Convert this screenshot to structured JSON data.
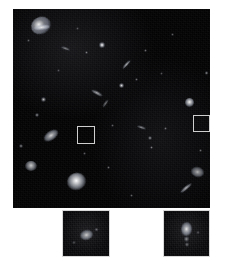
{
  "figure": {
    "background_color": "#ffffff",
    "sky_color": "#050506",
    "marker_color": "#cfcfcf",
    "caption": ""
  },
  "main_panel": {
    "name": "deep-field-image",
    "x": 13,
    "y": 9,
    "width": 197,
    "height": 199,
    "background": "#030304",
    "sources": [
      {
        "id": "spiral-galaxy-upper-left",
        "x": 18,
        "y": 8,
        "w": 20,
        "h": 17,
        "brightness": 0.95,
        "shape": "spiral",
        "angle": -25
      },
      {
        "id": "compact-source-1",
        "x": 14,
        "y": 30,
        "w": 3,
        "h": 3,
        "brightness": 0.35,
        "shape": "point",
        "angle": 0
      },
      {
        "id": "edge-on-disk-1",
        "x": 48,
        "y": 38,
        "w": 9,
        "h": 3,
        "brightness": 0.55,
        "shape": "edge-on",
        "angle": 20
      },
      {
        "id": "bright-star-1",
        "x": 86,
        "y": 33,
        "w": 6,
        "h": 6,
        "brightness": 1.0,
        "shape": "point",
        "angle": 0
      },
      {
        "id": "compact-source-2",
        "x": 72,
        "y": 42,
        "w": 3,
        "h": 3,
        "brightness": 0.45,
        "shape": "point",
        "angle": 0
      },
      {
        "id": "compact-source-3",
        "x": 131,
        "y": 40,
        "w": 3,
        "h": 3,
        "brightness": 0.4,
        "shape": "point",
        "angle": 0
      },
      {
        "id": "streak-source-1",
        "x": 108,
        "y": 54,
        "w": 11,
        "h": 3,
        "brightness": 0.8,
        "shape": "edge-on",
        "angle": -48
      },
      {
        "id": "compact-source-4",
        "x": 122,
        "y": 69,
        "w": 3,
        "h": 3,
        "brightness": 0.4,
        "shape": "point",
        "angle": 0
      },
      {
        "id": "bright-star-2",
        "x": 106,
        "y": 74,
        "w": 5,
        "h": 5,
        "brightness": 0.85,
        "shape": "point",
        "angle": 0
      },
      {
        "id": "edge-on-disk-2",
        "x": 78,
        "y": 82,
        "w": 12,
        "h": 4,
        "brightness": 0.7,
        "shape": "edge-on",
        "angle": 28
      },
      {
        "id": "edge-on-disk-3",
        "x": 88,
        "y": 93,
        "w": 9,
        "h": 3,
        "brightness": 0.5,
        "shape": "edge-on",
        "angle": -55
      },
      {
        "id": "compact-source-5",
        "x": 28,
        "y": 88,
        "w": 5,
        "h": 5,
        "brightness": 0.7,
        "shape": "point",
        "angle": 0
      },
      {
        "id": "compact-source-6",
        "x": 22,
        "y": 104,
        "w": 4,
        "h": 4,
        "brightness": 0.55,
        "shape": "point",
        "angle": 0
      },
      {
        "id": "bright-round-galaxy",
        "x": 172,
        "y": 89,
        "w": 9,
        "h": 9,
        "brightness": 0.95,
        "shape": "round",
        "angle": 0
      },
      {
        "id": "compact-source-7",
        "x": 192,
        "y": 62,
        "w": 3,
        "h": 4,
        "brightness": 0.55,
        "shape": "point",
        "angle": 0
      },
      {
        "id": "compact-source-8",
        "x": 151,
        "y": 118,
        "w": 3,
        "h": 3,
        "brightness": 0.4,
        "shape": "point",
        "angle": 0
      },
      {
        "id": "edge-on-disk-4",
        "x": 124,
        "y": 117,
        "w": 9,
        "h": 3,
        "brightness": 0.6,
        "shape": "edge-on",
        "angle": 18
      },
      {
        "id": "compact-source-9",
        "x": 135,
        "y": 127,
        "w": 4,
        "h": 4,
        "brightness": 0.55,
        "shape": "point",
        "angle": 0
      },
      {
        "id": "compact-source-10",
        "x": 137,
        "y": 137,
        "w": 3,
        "h": 3,
        "brightness": 0.45,
        "shape": "point",
        "angle": 0
      },
      {
        "id": "compact-source-11",
        "x": 98,
        "y": 115,
        "w": 3,
        "h": 3,
        "brightness": 0.35,
        "shape": "point",
        "angle": 0
      },
      {
        "id": "inclined-galaxy-1",
        "x": 30,
        "y": 122,
        "w": 16,
        "h": 9,
        "brightness": 0.85,
        "shape": "ellipse",
        "angle": -35
      },
      {
        "id": "compact-source-12",
        "x": 6,
        "y": 135,
        "w": 4,
        "h": 4,
        "brightness": 0.5,
        "shape": "point",
        "angle": 0
      },
      {
        "id": "elliptical-galaxy-2",
        "x": 12,
        "y": 152,
        "w": 12,
        "h": 10,
        "brightness": 0.78,
        "shape": "round",
        "angle": 0
      },
      {
        "id": "bright-elliptical-main",
        "x": 54,
        "y": 164,
        "w": 19,
        "h": 17,
        "brightness": 1.0,
        "shape": "round",
        "angle": -20
      },
      {
        "id": "compact-source-13",
        "x": 94,
        "y": 157,
        "w": 3,
        "h": 3,
        "brightness": 0.4,
        "shape": "point",
        "angle": 0
      },
      {
        "id": "compact-source-14",
        "x": 70,
        "y": 143,
        "w": 3,
        "h": 3,
        "brightness": 0.35,
        "shape": "point",
        "angle": 0
      },
      {
        "id": "edge-on-disk-5",
        "x": 166,
        "y": 177,
        "w": 14,
        "h": 4,
        "brightness": 0.75,
        "shape": "edge-on",
        "angle": -40
      },
      {
        "id": "elliptical-galaxy-3",
        "x": 178,
        "y": 158,
        "w": 13,
        "h": 10,
        "brightness": 0.7,
        "shape": "ellipse",
        "angle": 15
      },
      {
        "id": "compact-source-15",
        "x": 186,
        "y": 140,
        "w": 3,
        "h": 3,
        "brightness": 0.4,
        "shape": "point",
        "angle": 0
      },
      {
        "id": "compact-source-16",
        "x": 44,
        "y": 60,
        "w": 3,
        "h": 3,
        "brightness": 0.3,
        "shape": "point",
        "angle": 0
      },
      {
        "id": "compact-source-17",
        "x": 158,
        "y": 24,
        "w": 3,
        "h": 3,
        "brightness": 0.35,
        "shape": "point",
        "angle": 0
      },
      {
        "id": "compact-source-18",
        "x": 63,
        "y": 18,
        "w": 3,
        "h": 3,
        "brightness": 0.3,
        "shape": "point",
        "angle": 0
      },
      {
        "id": "compact-source-19",
        "x": 117,
        "y": 185,
        "w": 3,
        "h": 3,
        "brightness": 0.35,
        "shape": "point",
        "angle": 0
      },
      {
        "id": "compact-source-20",
        "x": 147,
        "y": 63,
        "w": 3,
        "h": 3,
        "brightness": 0.3,
        "shape": "point",
        "angle": 0
      }
    ],
    "marker_boxes": [
      {
        "id": "marker-box-left",
        "label": "",
        "x": 64,
        "y": 117,
        "w": 18,
        "h": 18
      },
      {
        "id": "marker-box-right",
        "label": "",
        "x": 180,
        "y": 106,
        "w": 17,
        "h": 17
      }
    ]
  },
  "insets": [
    {
      "id": "inset-left",
      "source_marker": "marker-box-left",
      "x": 62,
      "y": 210,
      "width": 48,
      "height": 47,
      "label": "",
      "sources": [
        {
          "id": "inset-left-object",
          "x": 17,
          "y": 19,
          "w": 13,
          "h": 10,
          "brightness": 0.8,
          "shape": "ellipse",
          "angle": -15
        },
        {
          "id": "inset-left-faint-1",
          "x": 31,
          "y": 17,
          "w": 5,
          "h": 3,
          "brightness": 0.35,
          "shape": "point",
          "angle": 0
        },
        {
          "id": "inset-left-faint-2",
          "x": 9,
          "y": 30,
          "w": 4,
          "h": 3,
          "brightness": 0.3,
          "shape": "point",
          "angle": 0
        }
      ]
    },
    {
      "id": "inset-right",
      "source_marker": "marker-box-right",
      "x": 163,
      "y": 210,
      "width": 47,
      "height": 47,
      "label": "",
      "sources": [
        {
          "id": "inset-right-object-core",
          "x": 17,
          "y": 11,
          "w": 11,
          "h": 14,
          "brightness": 0.9,
          "shape": "ellipse",
          "angle": 5
        },
        {
          "id": "inset-right-tail-1",
          "x": 20,
          "y": 25,
          "w": 5,
          "h": 6,
          "brightness": 0.5,
          "shape": "point",
          "angle": 0
        },
        {
          "id": "inset-right-tail-2",
          "x": 21,
          "y": 31,
          "w": 4,
          "h": 5,
          "brightness": 0.4,
          "shape": "point",
          "angle": 0
        },
        {
          "id": "inset-right-faint-1",
          "x": 32,
          "y": 20,
          "w": 4,
          "h": 3,
          "brightness": 0.3,
          "shape": "point",
          "angle": 0
        }
      ]
    }
  ]
}
